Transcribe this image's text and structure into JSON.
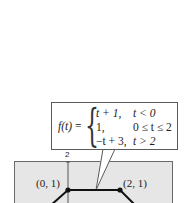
{
  "formula": {
    "lhs": "f(t)",
    "equals": "=",
    "cases": [
      {
        "expr": "t + 1,",
        "cond": "t < 0"
      },
      {
        "expr": "1,",
        "cond": "0 ≤ t ≤ 2"
      },
      {
        "expr": "−t + 3,",
        "cond": "t > 2"
      }
    ]
  },
  "graph": {
    "y_tick_label": "2",
    "points": [
      {
        "label": "(0, 1)",
        "x": 0,
        "y": 1
      },
      {
        "label": "(2, 1)",
        "x": 2,
        "y": 1
      }
    ],
    "colors": {
      "panel": "#e6e6e6",
      "line": "#111111",
      "border": "#6a6a6a"
    }
  }
}
